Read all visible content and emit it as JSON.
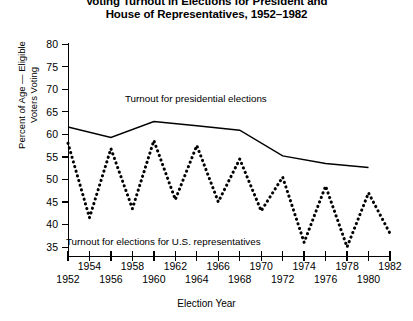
{
  "chart_data": {
    "type": "line",
    "title": "Voting Turnout in Elections for President and House of Representatives, 1952–1982",
    "title_line1": "Voting Turnout in Elections for President and",
    "title_line2": "House of Representatives, 1952–1982",
    "xlabel": "Election Year",
    "ylabel": "Percent of Age — Eligible\nVoters Voting",
    "ylabel_line1": "Percent of Age — Eligible",
    "ylabel_line2": "Voters Voting",
    "xlim": [
      1952,
      1982
    ],
    "ylim": [
      35,
      80
    ],
    "yticks": [
      80,
      75,
      70,
      65,
      60,
      55,
      50,
      45,
      40,
      35
    ],
    "ytick_labels": [
      "80",
      "75",
      "70",
      "65",
      "60",
      "55",
      "50",
      "45",
      "40",
      "35"
    ],
    "xticks": [
      1952,
      1954,
      1956,
      1958,
      1960,
      1962,
      1964,
      1966,
      1968,
      1970,
      1972,
      1974,
      1976,
      1978,
      1980,
      1982
    ],
    "xtick_labels_upper_row": [
      "1954",
      "1958",
      "1962",
      "1966",
      "1970",
      "1974",
      "1978",
      "1982"
    ],
    "xtick_labels_lower_row": [
      "1952",
      "1956",
      "1960",
      "1964",
      "1968",
      "1972",
      "1976",
      "1980"
    ],
    "grid": false,
    "legend": "none (in-plot annotations)",
    "series": [
      {
        "name": "Turnout for presidential elections",
        "style": "solid",
        "color": "#000000",
        "x": [
          1952,
          1956,
          1960,
          1964,
          1968,
          1972,
          1976,
          1980
        ],
        "values": [
          61.6,
          59.3,
          62.8,
          61.9,
          60.9,
          55.2,
          53.5,
          52.6
        ]
      },
      {
        "name": "Turnout for elections for U.S. representatives",
        "style": "dotted",
        "color": "#000000",
        "x": [
          1952,
          1954,
          1956,
          1958,
          1960,
          1962,
          1964,
          1966,
          1968,
          1970,
          1972,
          1974,
          1976,
          1978,
          1980,
          1982
        ],
        "values": [
          58.0,
          41.5,
          56.8,
          43.5,
          58.6,
          45.5,
          57.5,
          45.0,
          54.5,
          43.0,
          50.5,
          36.0,
          48.5,
          35.0,
          47.0,
          38.0
        ]
      }
    ],
    "annotations": [
      {
        "text": "Turnout for presidential elections",
        "x": 1957,
        "y": 66
      },
      {
        "text": "Turnout for elections for U.S. representatives",
        "x": 1952.5,
        "y": 36
      }
    ]
  }
}
